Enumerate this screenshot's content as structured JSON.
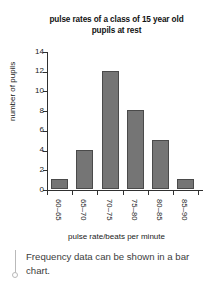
{
  "chart_data": {
    "type": "bar",
    "title": "pulse rates of a class of 15 year old pupils at rest",
    "title_line1": "pulse rates of a class of 15 year old",
    "title_line2": "pupils at rest",
    "xlabel": "pulse rate/beats per minute",
    "ylabel": "number of pupils",
    "categories": [
      "60–65",
      "65–70",
      "70–75",
      "75–80",
      "80–85",
      "85–90"
    ],
    "values": [
      1,
      4,
      12,
      8,
      5,
      1
    ],
    "ylim": [
      0,
      14
    ],
    "ytick_labels": [
      "0",
      "2",
      "4",
      "6",
      "8",
      "10",
      "12",
      "14"
    ],
    "ytick_values": [
      0,
      2,
      4,
      6,
      8,
      10,
      12,
      14
    ],
    "grid": false,
    "legend": false,
    "bar_color": "#757575",
    "bar_border_color": "#4a4a4a",
    "axis_color": "#303030"
  },
  "caption": {
    "text": "Frequency data can be shown in a bar chart.",
    "marker_icon": "pin-marker-icon"
  }
}
